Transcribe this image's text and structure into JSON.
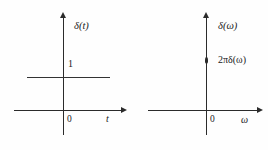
{
  "figure": {
    "background_color": "#fefefe",
    "stroke_color": "#2b2b2b",
    "width": 268,
    "height": 150
  },
  "panels": [
    {
      "id": "time-domain",
      "vertical_axis_label": "δ(t)",
      "horizontal_axis_label": "t",
      "origin_label": "0",
      "amplitude_label": "1",
      "plot_type": "constant-level-line",
      "level_value": 1
    },
    {
      "id": "frequency-domain",
      "vertical_axis_label": "δ(ω)",
      "horizontal_axis_label": "ω",
      "origin_label": "0",
      "amplitude_label": "2πδ(ω)",
      "plot_type": "impulse",
      "impulse_at": 0
    }
  ],
  "chart_data": [
    {
      "type": "line",
      "title": "",
      "xlabel": "t",
      "ylabel": "δ(t)",
      "x": [
        -0.85,
        0.85
      ],
      "values": [
        1,
        1
      ],
      "annotations": [
        "1"
      ],
      "tick_labels": {
        "x": [
          "0"
        ],
        "y": [
          "1"
        ]
      },
      "xlim": [
        -1.0,
        1.05
      ],
      "ylim": [
        -0.55,
        1.6
      ],
      "grid": false,
      "legend": "none"
    },
    {
      "type": "bar",
      "title": "",
      "xlabel": "ω",
      "ylabel": "δ(ω)",
      "categories": [
        "0"
      ],
      "values": [
        1
      ],
      "annotations": [
        "2πδ(ω)"
      ],
      "tick_labels": {
        "x": [
          "0"
        ],
        "y": []
      },
      "xlim": [
        -1.0,
        1.05
      ],
      "ylim": [
        -0.55,
        1.6
      ],
      "grid": false,
      "legend": "none"
    }
  ]
}
